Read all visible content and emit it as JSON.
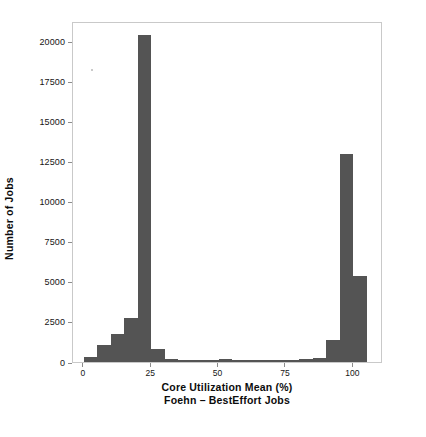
{
  "chart_data": {
    "type": "bar",
    "title": "",
    "xlabel": "Core Utilization Mean (%)",
    "xlabel_sub": "Foehn – BestEffort Jobs",
    "ylabel": "Number of Jobs",
    "grid": false,
    "legend": null,
    "xlim": [
      -4,
      111
    ],
    "ylim": [
      0,
      21300
    ],
    "bin_width": 5,
    "xticks": [
      0,
      25,
      50,
      75,
      100
    ],
    "xtick_labels": [
      "0",
      "25",
      "50",
      "75",
      "100"
    ],
    "yticks": [
      0,
      2500,
      5000,
      7500,
      10000,
      12500,
      15000,
      17500,
      20000
    ],
    "ytick_labels": [
      "0",
      "2500",
      "5000",
      "7500",
      "10000",
      "12500",
      "15000",
      "17500",
      "20000"
    ],
    "bar_color": "#545454",
    "bins": [
      {
        "x0": 0,
        "x1": 5,
        "value": 330
      },
      {
        "x0": 5,
        "x1": 10,
        "value": 1060
      },
      {
        "x0": 10,
        "x1": 15,
        "value": 1750
      },
      {
        "x0": 15,
        "x1": 20,
        "value": 2750
      },
      {
        "x0": 20,
        "x1": 25,
        "value": 20400
      },
      {
        "x0": 25,
        "x1": 30,
        "value": 800
      },
      {
        "x0": 30,
        "x1": 35,
        "value": 210
      },
      {
        "x0": 35,
        "x1": 40,
        "value": 150
      },
      {
        "x0": 40,
        "x1": 45,
        "value": 120
      },
      {
        "x0": 45,
        "x1": 50,
        "value": 110
      },
      {
        "x0": 50,
        "x1": 55,
        "value": 170
      },
      {
        "x0": 55,
        "x1": 60,
        "value": 110
      },
      {
        "x0": 60,
        "x1": 65,
        "value": 100
      },
      {
        "x0": 65,
        "x1": 70,
        "value": 95
      },
      {
        "x0": 70,
        "x1": 75,
        "value": 110
      },
      {
        "x0": 75,
        "x1": 80,
        "value": 130
      },
      {
        "x0": 80,
        "x1": 85,
        "value": 190
      },
      {
        "x0": 85,
        "x1": 90,
        "value": 230
      },
      {
        "x0": 90,
        "x1": 95,
        "value": 1350
      },
      {
        "x0": 95,
        "x1": 100,
        "value": 13000
      },
      {
        "x0": 100,
        "x1": 105,
        "value": 5400
      }
    ]
  }
}
